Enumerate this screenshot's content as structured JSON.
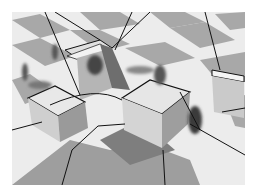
{
  "image": {
    "kind": "rendered-3d-scene",
    "description": "Grayscale render of a checkerboard floor with four white boxes, motion-blurred walking human figures, cast shadows, and black partition lines overlaid",
    "colors": {
      "background": "#ffffff",
      "floor_light": "#ececec",
      "floor_dark": "#a8a8a8",
      "box_top": "#e4e4e4",
      "box_side_light": "#d0d0d0",
      "box_side_dark": "#9a9a9a",
      "shadow": "#8c8c8c",
      "partition_line": "#111111",
      "figure": "#555555"
    },
    "objects": {
      "boxes": [
        {
          "name": "back-left-box"
        },
        {
          "name": "front-left-box"
        },
        {
          "name": "center-box"
        },
        {
          "name": "right-box"
        }
      ],
      "figures_count": 5,
      "partition_lines": true
    }
  }
}
